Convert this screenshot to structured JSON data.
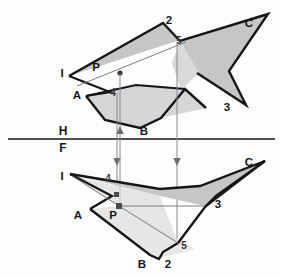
{
  "drawing": {
    "title": "Two-view orthographic projection: intersecting planes with point P",
    "views": {
      "top": {
        "name": "H",
        "label": "H"
      },
      "front": {
        "name": "F",
        "label": "F"
      }
    },
    "reference_line": {
      "upper_label": "H",
      "lower_label": "F",
      "y": 139,
      "x_start": 8,
      "x_end": 275
    },
    "colors": {
      "line": "#16161a",
      "thin_line": "#8a8a90",
      "fill_mid": "#c3c3c3",
      "fill_light": "#dedede",
      "fill_pale": "#ececec",
      "fill_dark": "#b0b0b0",
      "background": "#fdfdfd"
    },
    "top_view": {
      "labels": [
        {
          "text": "I",
          "x": 62,
          "y": 77
        },
        {
          "text": "A",
          "x": 77,
          "y": 99
        },
        {
          "text": "P",
          "x": 96,
          "y": 71
        },
        {
          "text": "4",
          "x": 113,
          "y": 96
        },
        {
          "text": "B",
          "x": 144,
          "y": 135
        },
        {
          "text": "2",
          "x": 169,
          "y": 24
        },
        {
          "text": "5",
          "x": 179,
          "y": 44
        },
        {
          "text": "C",
          "x": 249,
          "y": 27
        },
        {
          "text": "3",
          "x": 227,
          "y": 111
        }
      ],
      "point_p": {
        "x": 120,
        "y": 73
      }
    },
    "front_view": {
      "labels": [
        {
          "text": "I",
          "x": 62,
          "y": 180
        },
        {
          "text": "A",
          "x": 78,
          "y": 219
        },
        {
          "text": "P",
          "x": 113,
          "y": 217
        },
        {
          "text": "4",
          "x": 108,
          "y": 182
        },
        {
          "text": "B",
          "x": 142,
          "y": 266
        },
        {
          "text": "2",
          "x": 168,
          "y": 266
        },
        {
          "text": "5",
          "x": 184,
          "y": 247
        },
        {
          "text": "C",
          "x": 249,
          "y": 166
        },
        {
          "text": "3",
          "x": 218,
          "y": 208
        }
      ],
      "point_p": {
        "x": 118,
        "y": 206
      }
    },
    "projectors": [
      {
        "name": "projector-4",
        "x": 117,
        "from_y": 93,
        "to_y": 185,
        "arrow": "down"
      },
      {
        "name": "projector-p",
        "x": 120,
        "from_y": 205,
        "to_y": 75,
        "arrow": "up"
      },
      {
        "name": "projector-5",
        "x": 177,
        "from_y": 47,
        "to_y": 243,
        "arrow": "down"
      }
    ]
  }
}
